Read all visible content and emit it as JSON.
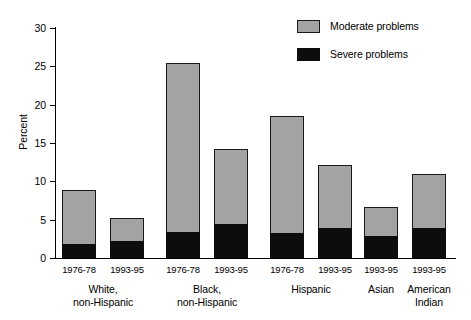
{
  "chart_data": {
    "type": "bar",
    "subtype": "stacked",
    "title": "",
    "xlabel": "",
    "ylabel": "Percent",
    "ylim": [
      0,
      30
    ],
    "yticks": [
      0,
      5,
      10,
      15,
      20,
      25,
      30
    ],
    "ytick_labels": [
      "0",
      "5",
      "10",
      "15",
      "20",
      "25",
      "30"
    ],
    "grid": false,
    "legend_position": "top-right",
    "legend": [
      "Moderate problems",
      "Severe problems"
    ],
    "categories": [
      "1976-78",
      "1993-95",
      "1976-78",
      "1993-95",
      "1976-78",
      "1993-95",
      "1993-95",
      "1993-95"
    ],
    "groups": [
      {
        "label": "White,\nnon-Hispanic",
        "line1": "White,",
        "line2": "non-Hispanic",
        "bar_indices": [
          0,
          1
        ]
      },
      {
        "label": "Black,\nnon-Hispanic",
        "line1": "Black,",
        "line2": "non-Hispanic",
        "bar_indices": [
          2,
          3
        ]
      },
      {
        "label": "Hispanic",
        "line1": "Hispanic",
        "line2": "",
        "bar_indices": [
          4,
          5
        ]
      },
      {
        "label": "Asian",
        "line1": "Asian",
        "line2": "",
        "bar_indices": [
          6
        ]
      },
      {
        "label": "American\nIndian",
        "line1": "American",
        "line2": "Indian",
        "bar_indices": [
          7
        ]
      }
    ],
    "series": [
      {
        "name": "Severe problems",
        "color": "#0d0d0d",
        "values": [
          1.8,
          2.2,
          3.4,
          4.4,
          3.3,
          3.9,
          2.9,
          3.9
        ]
      },
      {
        "name": "Moderate problems",
        "color": "#a3a3a3",
        "values": [
          7.1,
          3.0,
          22.1,
          9.8,
          15.2,
          8.2,
          3.8,
          7.0
        ]
      }
    ],
    "totals": [
      8.9,
      5.2,
      25.5,
      14.2,
      18.5,
      12.1,
      6.7,
      10.9
    ],
    "bars": [
      {
        "category": "1976-78",
        "group": "White, non-Hispanic",
        "severe": 1.8,
        "moderate": 7.1,
        "total": 8.9
      },
      {
        "category": "1993-95",
        "group": "White, non-Hispanic",
        "severe": 2.2,
        "moderate": 3.0,
        "total": 5.2
      },
      {
        "category": "1976-78",
        "group": "Black, non-Hispanic",
        "severe": 3.4,
        "moderate": 22.1,
        "total": 25.5
      },
      {
        "category": "1993-95",
        "group": "Black, non-Hispanic",
        "severe": 4.4,
        "moderate": 9.8,
        "total": 14.2
      },
      {
        "category": "1976-78",
        "group": "Hispanic",
        "severe": 3.3,
        "moderate": 15.2,
        "total": 18.5
      },
      {
        "category": "1993-95",
        "group": "Hispanic",
        "severe": 3.9,
        "moderate": 8.2,
        "total": 12.1
      },
      {
        "category": "1993-95",
        "group": "Asian",
        "severe": 2.9,
        "moderate": 3.8,
        "total": 6.7
      },
      {
        "category": "1993-95",
        "group": "American Indian",
        "severe": 3.9,
        "moderate": 7.0,
        "total": 10.9
      }
    ]
  },
  "axis": {
    "y_title": "Percent",
    "y_labels": {
      "t0": "0",
      "t5": "5",
      "t10": "10",
      "t15": "15",
      "t20": "20",
      "t25": "25",
      "t30": "30"
    }
  },
  "legend": {
    "moderate_label": "Moderate problems",
    "severe_label": "Severe problems"
  },
  "x_labels": {
    "b0": "1976-78",
    "b1": "1993-95",
    "b2": "1976-78",
    "b3": "1993-95",
    "b4": "1976-78",
    "b5": "1993-95",
    "b6": "1993-95",
    "b7": "1993-95"
  },
  "group_labels": {
    "g0_l1": "White,",
    "g0_l2": "non-Hispanic",
    "g1_l1": "Black,",
    "g1_l2": "non-Hispanic",
    "g2_l1": "Hispanic",
    "g2_l2": "",
    "g3_l1": "Asian",
    "g3_l2": "",
    "g4_l1": "American",
    "g4_l2": "Indian"
  },
  "colors": {
    "moderate": "#a3a3a3",
    "severe": "#0d0d0d",
    "axis": "#000000",
    "background": "#ffffff"
  }
}
